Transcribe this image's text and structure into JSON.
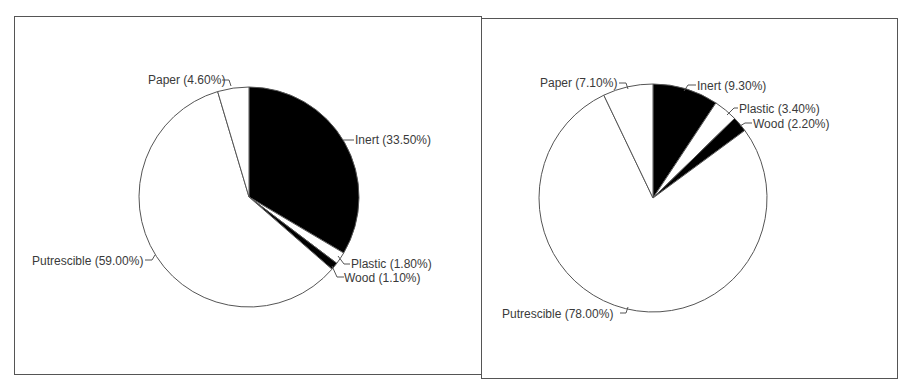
{
  "chart_data": [
    {
      "type": "pie",
      "title": "",
      "categories": [
        "Inert",
        "Plastic",
        "Wood",
        "Putrescible",
        "Paper"
      ],
      "values": [
        33.5,
        1.8,
        1.1,
        59.0,
        4.6
      ],
      "labels": [
        "Inert (33.50%)",
        "Plastic (1.80%)",
        "Wood (1.10%)",
        "Putrescible (59.00%)",
        "Paper (4.60%)"
      ],
      "fills": [
        "#000000",
        "#ffffff",
        "#000000",
        "#ffffff",
        "#ffffff"
      ],
      "start_angle": "12 o'clock, clockwise",
      "legend": "none (leader-line labels)"
    },
    {
      "type": "pie",
      "title": "",
      "categories": [
        "Inert",
        "Plastic",
        "Wood",
        "Putrescible",
        "Paper"
      ],
      "values": [
        9.3,
        3.4,
        2.2,
        78.0,
        7.1
      ],
      "labels": [
        "Inert (9.30%)",
        "Plastic (3.40%)",
        "Wood (2.20%)",
        "Putrescible (78.00%)",
        "Paper (7.10%)"
      ],
      "fills": [
        "#000000",
        "#ffffff",
        "#000000",
        "#ffffff",
        "#ffffff"
      ],
      "start_angle": "12 o'clock, clockwise",
      "legend": "none (leader-line labels)"
    }
  ],
  "charts": {
    "left": {
      "inert": "Inert (33.50%)",
      "plastic": "Plastic (1.80%)",
      "wood": "Wood (1.10%)",
      "putrescible": "Putrescible (59.00%)",
      "paper": "Paper (4.60%)"
    },
    "right": {
      "inert": "Inert (9.30%)",
      "plastic": "Plastic (3.40%)",
      "wood": "Wood (2.20%)",
      "putrescible": "Putrescible (78.00%)",
      "paper": "Paper (7.10%)"
    }
  },
  "colors": {
    "dark_slice": "#000000",
    "light_slice": "#ffffff",
    "outline": "#555555",
    "text": "#3a3a3a"
  }
}
